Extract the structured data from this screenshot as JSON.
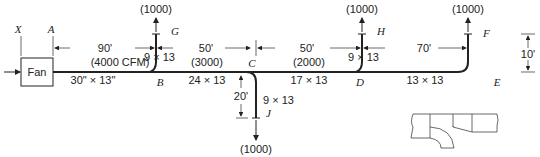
{
  "diagram": {
    "fan_label": "Fan",
    "points": {
      "X": "X",
      "A": "A",
      "B": "B",
      "C": "C",
      "D": "D",
      "E": "E",
      "F": "F",
      "G": "G",
      "H": "H",
      "J": "J"
    },
    "dimensions": {
      "AB": "90'",
      "BC": "50'",
      "CD": "50'",
      "DE": "70'",
      "EF": "10'",
      "CJ": "20'"
    },
    "sections": {
      "AB_flow": "(4000 CFM)",
      "AB_size": "30\" × 13\"",
      "BC_flow": "(3000)",
      "BC_size": "24 × 13",
      "CD_flow": "(2000)",
      "CD_size": "17 × 13",
      "DE_size": "13 × 13"
    },
    "branches": {
      "G_flow": "(1000)",
      "G_size": "9 × 13",
      "H_flow": "(1000)",
      "H_size": "9 × 13",
      "F_flow": "(1000)",
      "J_flow": "(1000)",
      "J_size": "9 × 13"
    }
  }
}
